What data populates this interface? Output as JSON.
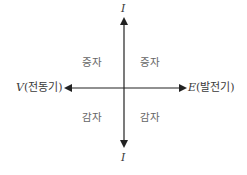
{
  "diagram": {
    "type": "quadrant-axes",
    "axes": {
      "vertical": {
        "top_label": "I",
        "bottom_label": "I"
      },
      "horizontal": {
        "left_label": {
          "symbol": "V",
          "text": "(전동기)"
        },
        "right_label": {
          "symbol": "E",
          "text": "(발전기)"
        }
      }
    },
    "quadrants": {
      "top_left": "증자",
      "top_right": "증자",
      "bottom_left": "감자",
      "bottom_right": "감자"
    },
    "colors": {
      "line": "#222222",
      "text": "#3a3a3a",
      "quadrant_text": "#666666"
    }
  }
}
